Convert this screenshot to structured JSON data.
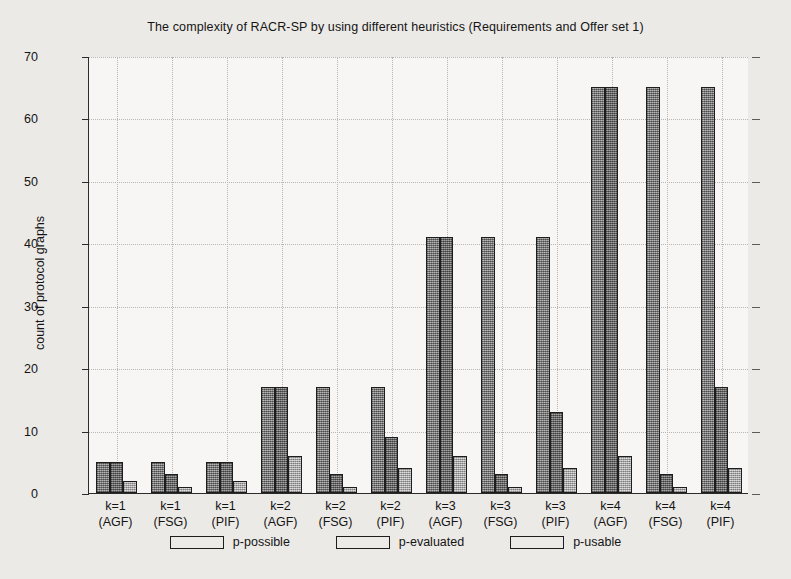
{
  "chart_data": {
    "type": "bar",
    "title": "The complexity of RACR-SP by using different heuristics (Requirements and Offer set 1)",
    "xlabel": "",
    "ylabel": "count of protocol graphs",
    "ylim": [
      0,
      70
    ],
    "yticks": [
      0,
      10,
      20,
      30,
      40,
      50,
      60,
      70
    ],
    "grid": true,
    "legend_position": "bottom",
    "categories": [
      "k=1 (AGF)",
      "k=1 (FSG)",
      "k=1 (PIF)",
      "k=2 (AGF)",
      "k=2 (FSG)",
      "k=2 (PIF)",
      "k=3 (AGF)",
      "k=3 (FSG)",
      "k=3 (PIF)",
      "k=4 (AGF)",
      "k=4 (FSG)",
      "k=4 (PIF)"
    ],
    "category_lines": [
      [
        "k=1",
        "(AGF)"
      ],
      [
        "k=1",
        "(FSG)"
      ],
      [
        "k=1",
        "(PIF)"
      ],
      [
        "k=2",
        "(AGF)"
      ],
      [
        "k=2",
        "(FSG)"
      ],
      [
        "k=2",
        "(PIF)"
      ],
      [
        "k=3",
        "(AGF)"
      ],
      [
        "k=3",
        "(FSG)"
      ],
      [
        "k=3",
        "(PIF)"
      ],
      [
        "k=4",
        "(AGF)"
      ],
      [
        "k=4",
        "(FSG)"
      ],
      [
        "k=4",
        "(PIF)"
      ]
    ],
    "series": [
      {
        "name": "p-possible",
        "color": "#8e8e8e",
        "values": [
          5,
          5,
          5,
          17,
          17,
          17,
          41,
          41,
          41,
          65,
          65,
          65
        ]
      },
      {
        "name": "p-evaluated",
        "color": "#818181",
        "values": [
          5,
          3,
          5,
          17,
          3,
          9,
          41,
          3,
          13,
          65,
          3,
          17
        ]
      },
      {
        "name": "p-usable",
        "color": "#b6b6b6",
        "values": [
          2,
          1,
          2,
          6,
          1,
          4,
          6,
          1,
          4,
          6,
          1,
          4
        ]
      }
    ]
  },
  "legend": {
    "items": [
      {
        "label": "p-possible"
      },
      {
        "label": "p-evaluated"
      },
      {
        "label": "p-usable"
      }
    ]
  }
}
